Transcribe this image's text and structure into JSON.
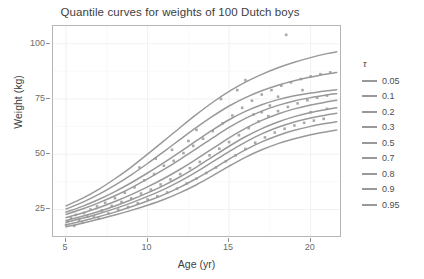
{
  "chart_data": {
    "type": "line",
    "title": "Quantile curves for weights of 100 Dutch boys",
    "xlabel": "Age (yr)",
    "ylabel": "Weight (kg)",
    "xlim": [
      4.2,
      21.8
    ],
    "ylim": [
      13,
      108
    ],
    "xticks": [
      5,
      10,
      15,
      20
    ],
    "yticks": [
      25,
      50,
      75,
      100
    ],
    "grid": true,
    "legend_title": "τ",
    "legend_position": "right",
    "line_color": "#999999",
    "point_color": "#9a9a9a",
    "panel_border_color": "#b5b5b5",
    "grid_color": "#f2f2f2",
    "series": [
      {
        "name": "0.05",
        "tau": 0.05,
        "x": [
          5,
          6,
          7,
          8,
          9,
          10,
          11,
          12,
          13,
          14,
          15,
          16,
          17,
          18,
          19,
          20,
          21,
          21.6
        ],
        "values": [
          17.2,
          18.8,
          20.6,
          22.5,
          24.6,
          26.9,
          29.5,
          32.6,
          36.2,
          40.3,
          44.6,
          48.6,
          52.0,
          54.8,
          57.0,
          58.8,
          60.2,
          60.9
        ]
      },
      {
        "name": "0.1",
        "tau": 0.1,
        "x": [
          5,
          6,
          7,
          8,
          9,
          10,
          11,
          12,
          13,
          14,
          15,
          16,
          17,
          18,
          19,
          20,
          21,
          21.6
        ],
        "values": [
          18.1,
          19.8,
          21.7,
          23.8,
          26.2,
          28.8,
          31.7,
          35.1,
          39.0,
          43.3,
          47.8,
          52.0,
          55.6,
          58.5,
          60.8,
          62.6,
          64.0,
          64.7
        ]
      },
      {
        "name": "0.2",
        "tau": 0.2,
        "x": [
          5,
          6,
          7,
          8,
          9,
          10,
          11,
          12,
          13,
          14,
          15,
          16,
          17,
          18,
          19,
          20,
          21,
          21.6
        ],
        "values": [
          19.2,
          21.0,
          23.1,
          25.4,
          28.0,
          30.9,
          34.1,
          37.8,
          42.0,
          46.6,
          51.2,
          55.5,
          59.2,
          62.2,
          64.6,
          66.4,
          67.8,
          68.5
        ]
      },
      {
        "name": "0.3",
        "tau": 0.3,
        "x": [
          5,
          6,
          7,
          8,
          9,
          10,
          11,
          12,
          13,
          14,
          15,
          16,
          17,
          18,
          19,
          20,
          21,
          21.6
        ],
        "values": [
          20.0,
          21.9,
          24.1,
          26.6,
          29.4,
          32.5,
          35.9,
          39.8,
          44.2,
          48.9,
          53.6,
          57.9,
          61.6,
          64.6,
          67.0,
          68.9,
          70.3,
          71.0
        ]
      },
      {
        "name": "0.5",
        "tau": 0.5,
        "x": [
          5,
          6,
          7,
          8,
          9,
          10,
          11,
          12,
          13,
          14,
          15,
          16,
          17,
          18,
          19,
          20,
          21,
          21.6
        ],
        "values": [
          21.3,
          23.4,
          25.8,
          28.6,
          31.7,
          35.2,
          39.0,
          43.2,
          47.8,
          52.6,
          57.4,
          61.7,
          65.3,
          68.2,
          70.5,
          72.3,
          73.7,
          74.4
        ]
      },
      {
        "name": "0.7",
        "tau": 0.7,
        "x": [
          5,
          6,
          7,
          8,
          9,
          10,
          11,
          12,
          13,
          14,
          15,
          16,
          17,
          18,
          19,
          20,
          21,
          21.6
        ],
        "values": [
          22.8,
          25.2,
          28.0,
          31.2,
          34.8,
          38.8,
          43.1,
          47.7,
          52.5,
          57.4,
          62.1,
          66.2,
          69.5,
          72.1,
          74.1,
          75.6,
          76.8,
          77.4
        ]
      },
      {
        "name": "0.8",
        "tau": 0.8,
        "x": [
          5,
          6,
          7,
          8,
          9,
          10,
          11,
          12,
          13,
          14,
          15,
          16,
          17,
          18,
          19,
          20,
          21,
          21.6
        ],
        "values": [
          23.8,
          26.4,
          29.5,
          33.1,
          37.1,
          41.5,
          46.2,
          51.1,
          56.1,
          61.0,
          65.6,
          69.4,
          72.4,
          74.7,
          76.4,
          77.7,
          78.7,
          79.2
        ]
      },
      {
        "name": "0.9",
        "tau": 0.9,
        "x": [
          5,
          6,
          7,
          8,
          9,
          10,
          11,
          12,
          13,
          14,
          15,
          16,
          17,
          18,
          19,
          20,
          21,
          21.6
        ],
        "values": [
          25.2,
          28.2,
          31.8,
          36.0,
          40.7,
          45.8,
          51.2,
          56.7,
          62.1,
          67.2,
          71.8,
          75.6,
          78.7,
          81.2,
          83.2,
          84.9,
          86.3,
          87.0
        ]
      },
      {
        "name": "0.95",
        "tau": 0.95,
        "x": [
          5,
          6,
          7,
          8,
          9,
          10,
          11,
          12,
          13,
          14,
          15,
          16,
          17,
          18,
          19,
          20,
          21,
          21.6
        ],
        "values": [
          26.6,
          30.0,
          34.1,
          38.9,
          44.2,
          50.0,
          56.0,
          62.1,
          68.0,
          73.5,
          78.4,
          82.6,
          86.1,
          89.1,
          91.6,
          93.7,
          95.5,
          96.3
        ]
      }
    ],
    "points": [
      [
        5.0,
        18.0
      ],
      [
        5.1,
        19.6
      ],
      [
        5.3,
        21.2
      ],
      [
        5.5,
        17.6
      ],
      [
        5.6,
        22.5
      ],
      [
        5.8,
        20.3
      ],
      [
        6.0,
        19.0
      ],
      [
        6.1,
        23.4
      ],
      [
        6.3,
        21.8
      ],
      [
        6.5,
        25.0
      ],
      [
        6.7,
        22.0
      ],
      [
        6.9,
        26.4
      ],
      [
        7.0,
        20.9
      ],
      [
        7.2,
        24.5
      ],
      [
        7.4,
        28.0
      ],
      [
        7.6,
        23.2
      ],
      [
        7.8,
        26.6
      ],
      [
        8.0,
        30.1
      ],
      [
        8.2,
        24.9
      ],
      [
        8.4,
        28.4
      ],
      [
        8.6,
        32.6
      ],
      [
        8.8,
        26.1
      ],
      [
        9.0,
        30.0
      ],
      [
        9.2,
        35.0
      ],
      [
        9.4,
        27.8
      ],
      [
        9.6,
        32.2
      ],
      [
        9.8,
        38.2
      ],
      [
        10.0,
        29.5
      ],
      [
        10.2,
        34.0
      ],
      [
        10.4,
        41.0
      ],
      [
        10.6,
        31.0
      ],
      [
        10.8,
        36.3
      ],
      [
        11.0,
        44.8
      ],
      [
        11.2,
        32.7
      ],
      [
        11.4,
        38.6
      ],
      [
        11.6,
        47.0
      ],
      [
        11.8,
        34.4
      ],
      [
        12.0,
        41.0
      ],
      [
        12.2,
        50.5
      ],
      [
        12.4,
        36.8
      ],
      [
        12.6,
        43.7
      ],
      [
        12.8,
        53.8
      ],
      [
        13.0,
        39.0
      ],
      [
        13.2,
        46.5
      ],
      [
        13.4,
        57.0
      ],
      [
        13.6,
        41.5
      ],
      [
        13.8,
        49.5
      ],
      [
        14.0,
        60.5
      ],
      [
        14.2,
        44.0
      ],
      [
        14.4,
        52.5
      ],
      [
        14.6,
        64.0
      ],
      [
        14.8,
        46.8
      ],
      [
        15.0,
        55.5
      ],
      [
        15.2,
        67.5
      ],
      [
        15.4,
        49.5
      ],
      [
        15.6,
        58.6
      ],
      [
        15.8,
        71.0
      ],
      [
        16.0,
        52.4
      ],
      [
        16.2,
        61.8
      ],
      [
        16.4,
        74.2
      ],
      [
        16.6,
        55.2
      ],
      [
        16.8,
        64.8
      ],
      [
        17.0,
        77.0
      ],
      [
        17.2,
        57.6
      ],
      [
        17.4,
        67.2
      ],
      [
        17.6,
        79.0
      ],
      [
        17.8,
        59.8
      ],
      [
        18.0,
        69.5
      ],
      [
        18.2,
        81.0
      ],
      [
        18.4,
        61.5
      ],
      [
        18.5,
        104.0
      ],
      [
        18.6,
        71.4
      ],
      [
        18.8,
        82.5
      ],
      [
        19.0,
        63.0
      ],
      [
        19.2,
        73.0
      ],
      [
        19.4,
        84.0
      ],
      [
        19.6,
        64.2
      ],
      [
        19.8,
        74.4
      ],
      [
        20.0,
        85.2
      ],
      [
        20.2,
        65.2
      ],
      [
        20.4,
        75.6
      ],
      [
        20.6,
        86.2
      ],
      [
        20.8,
        66.0
      ],
      [
        21.0,
        76.5
      ],
      [
        21.2,
        87.0
      ],
      [
        13.0,
        61.0
      ],
      [
        14.5,
        75.0
      ],
      [
        15.5,
        79.0
      ],
      [
        16.5,
        68.0
      ],
      [
        17.5,
        72.0
      ],
      [
        12.5,
        56.0
      ],
      [
        11.5,
        52.0
      ],
      [
        10.5,
        48.0
      ],
      [
        9.5,
        44.0
      ],
      [
        19.5,
        79.0
      ],
      [
        16.0,
        83.5
      ],
      [
        17.0,
        69.0
      ],
      [
        18.0,
        76.0
      ],
      [
        20.0,
        69.0
      ],
      [
        21.0,
        70.5
      ]
    ]
  },
  "legend": {
    "title": "τ",
    "items": [
      {
        "label": "0.05"
      },
      {
        "label": "0.1"
      },
      {
        "label": "0.2"
      },
      {
        "label": "0.3"
      },
      {
        "label": "0.5"
      },
      {
        "label": "0.7"
      },
      {
        "label": "0.8"
      },
      {
        "label": "0.9"
      },
      {
        "label": "0.95"
      }
    ]
  }
}
